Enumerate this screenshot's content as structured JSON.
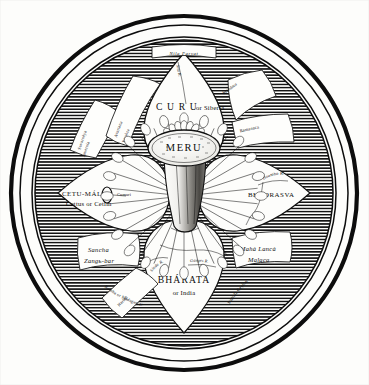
{
  "plate": {
    "title": "MERU",
    "description": "Circular engraved cosmographic plate: Mount Meru at the centre of an eight-petalled lotus world surrounded by a hatched encircling ocean and triple border rings.",
    "ink_color": "#0d0d0d",
    "paper_color": "#fdfdfb",
    "ocean_fill": "hatched"
  },
  "center": {
    "summit_label": "MERU",
    "cap_name": "meru-summit-ellipse",
    "trunk_name": "meru-trunk"
  },
  "border": {
    "outer_ring": "outer-thick-ring",
    "middle_ring": "middle-thin-ring",
    "inner_ring": "inner-thin-ring",
    "ocean_band": "hatched-ocean-band"
  },
  "top_cartouche": {
    "label": "Nila Parvat"
  },
  "petals": [
    {
      "id": "curu",
      "position": "north",
      "name": "CURU",
      "alt": "or Siberia",
      "display": "C U R U",
      "alt_display": "or Siberia"
    },
    {
      "id": "bhadrasva",
      "position": "east",
      "name": "BHADRASVA",
      "alt": "",
      "display": "BHADRASVA",
      "alt_display": ""
    },
    {
      "id": "bharata",
      "position": "south",
      "name": "BHARATA",
      "alt": "or India",
      "display": "BHÁRATA",
      "alt_display": "or India"
    },
    {
      "id": "cetumal",
      "position": "west",
      "name": "CETU-MÁL",
      "alt": "Cettus or Cetim",
      "display": "CETU-MÁL",
      "alt_display": "Cettus or Cetim"
    }
  ],
  "intermediate_islands": [
    {
      "id": "avartana",
      "position": "north-west",
      "name": "Avartana",
      "alt": "Petsòra"
    },
    {
      "id": "mandara",
      "position": "north-east",
      "name": "Mandara",
      "alt": ""
    },
    {
      "id": "ramanaca",
      "position": "east-north-east",
      "name": "Ramanaca",
      "alt": ""
    },
    {
      "id": "maha-lanca",
      "position": "south-east",
      "name": "Mahà Lancà",
      "alt": "Malaca"
    },
    {
      "id": "harina",
      "position": "south-west",
      "name": "Harinà",
      "alt": "Romba or Madagascar"
    },
    {
      "id": "sancha",
      "position": "west-south-west",
      "name": "Sancha",
      "alt": "Zangь-bar"
    },
    {
      "id": "suvarneya",
      "position": "north-north-west",
      "name": "Suvarnëya",
      "alt": "Jauernia"
    }
  ],
  "rivers": [
    {
      "id": "sita",
      "label": "Sita R.",
      "petal": "curu"
    },
    {
      "id": "hoamho",
      "label": "Hoamho R.",
      "petal": "bhadrasva"
    },
    {
      "id": "sindu",
      "label": "Sindu R.",
      "petal": "bharata"
    },
    {
      "id": "ganga",
      "label": "Ganges R.",
      "petal": "bharata"
    },
    {
      "id": "cumari",
      "label": "Cumari",
      "petal": "cetumal"
    }
  ],
  "minor_labels": [
    {
      "id": "sinhala",
      "label": "Sinhala Ceylon"
    },
    {
      "id": "romba",
      "label": "Romba or Madagascar"
    },
    {
      "id": "cumari-point",
      "label": "Cumari"
    }
  ]
}
